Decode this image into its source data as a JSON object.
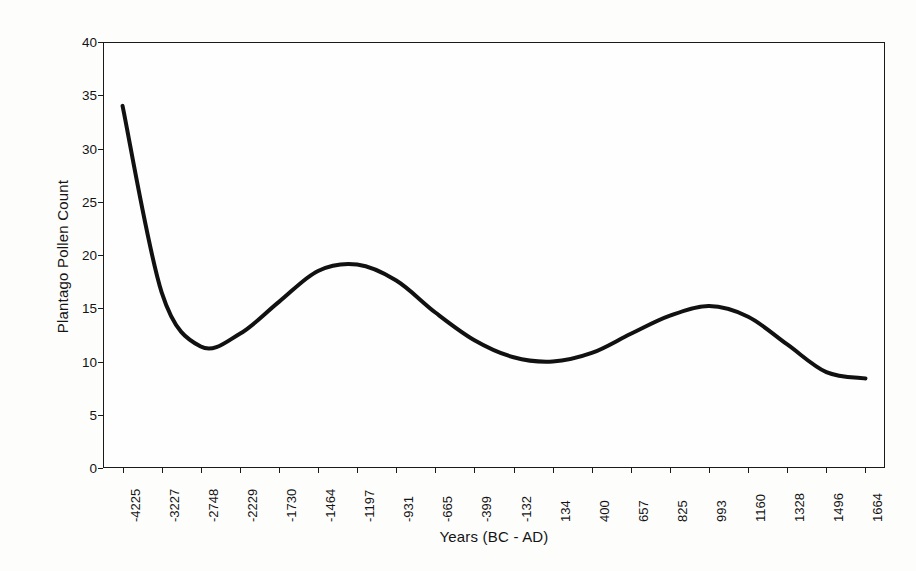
{
  "chart_data": {
    "type": "line",
    "title": "",
    "xlabel": "Years (BC - AD)",
    "ylabel": "Plantago Pollen Count",
    "ylim": [
      0,
      40
    ],
    "ytick_values": [
      0,
      5,
      10,
      15,
      20,
      25,
      30,
      35,
      40
    ],
    "grid": false,
    "legend": false,
    "line_color": "#111111",
    "line_width": 4,
    "categories": [
      "-4225",
      "-3227",
      "-2748",
      "-2229",
      "-1730",
      "-1464",
      "-1197",
      "-931",
      "-665",
      "-399",
      "-132",
      "134",
      "400",
      "657",
      "825",
      "993",
      "1160",
      "1328",
      "1496",
      "1664"
    ],
    "series": [
      {
        "name": "Plantago Pollen Count",
        "values": [
          34.0,
          16.5,
          11.4,
          12.6,
          15.6,
          18.5,
          19.1,
          17.6,
          14.6,
          12.0,
          10.4,
          10.0,
          10.8,
          12.6,
          14.3,
          15.2,
          14.2,
          11.6,
          9.0,
          8.4
        ]
      }
    ]
  },
  "axes": {
    "x_title": "Years (BC - AD)",
    "y_title": "Plantago Pollen Count"
  }
}
